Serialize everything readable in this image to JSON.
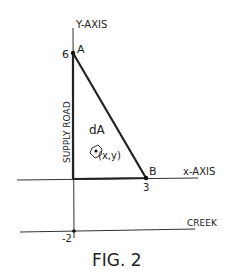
{
  "figure": {
    "caption": "FIG. 2",
    "axes": {
      "y_label": "Y-AXIS",
      "x_label": "x-AXIS",
      "y_tick_top": "6",
      "y_tick_bottom": "-2",
      "x_tick": "3"
    },
    "points": {
      "a_label": "A",
      "b_label": "B"
    },
    "road_label": "SUPPLY ROAD",
    "element_label": "dA",
    "element_coords": "(x,y)",
    "creek_label": "CREEK",
    "colors": {
      "ink": "#222222",
      "background": "#ffffff"
    }
  }
}
